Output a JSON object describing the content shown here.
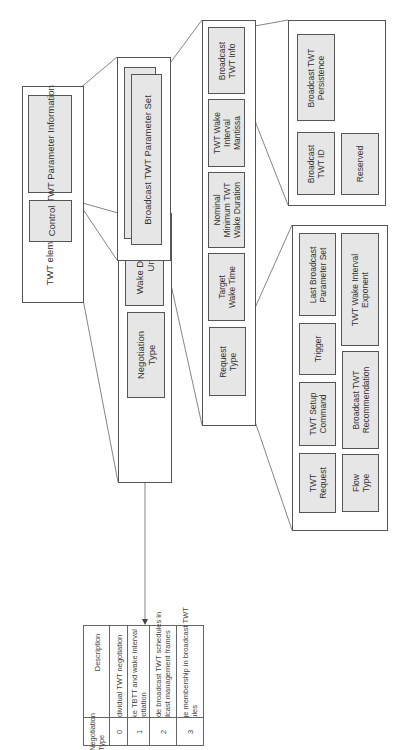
{
  "diagram": {
    "twt_element": {
      "label": "TWT element",
      "fields": {
        "control": "Control",
        "twt_parameter_information": "TWT Parameter Information"
      }
    },
    "control_detail": {
      "fields": {
        "wake_duration_unit": "Wake Duration\nUnit",
        "negotiation_type": "Negotiation\nType"
      }
    },
    "twt_parameter_information_detail": {
      "fields": {
        "broadcast_twt_parameter_set": "Broadcast TWT Parameter Set"
      }
    },
    "broadcast_twt_parameter_set_detail": {
      "fields": {
        "broadcast_twt_info": "Broadcast\nTWT Info",
        "twt_wake_interval_mantissa": "TWT Wake\nInterval\nMantissa",
        "nominal_minimum_twt_wake_duration": "Nominal\nMinimum TWT\nWake Duration",
        "target_wake_time": "Target\nWake Time",
        "request_type": "Request\nType"
      }
    },
    "broadcast_twt_info_detail": {
      "fields": {
        "broadcast_twt_persistence": "Broadcast TWT\nPersistence",
        "broadcast_twt_id": "Broadcast\nTWT ID",
        "reserved": "Reserved"
      }
    },
    "request_type_detail": {
      "fields": {
        "last_broadcast_parameter_set": "Last Broadcast\nParameter Set",
        "trigger": "Trigger",
        "twt_setup_command": "TWT Setup\nCommand",
        "twt_request": "TWT\nRequest",
        "twt_wake_interval_exponent": "TWT Wake Interval\nExponent",
        "broadcast_twt_recommendation": "Broadcast TWT\nRecommendation",
        "flow_type": "Flow\nType"
      }
    },
    "negotiation_table": {
      "headers": [
        "Negotiation\nType",
        "Description"
      ],
      "rows": [
        {
          "type": "0",
          "description": "Individual TWT negotiation"
        },
        {
          "type": "1",
          "description": "Wake TBTT and wake interval\nnegotiation"
        },
        {
          "type": "2",
          "description": "Provide broadcast TWT schedules in\nbroadcast management frames"
        },
        {
          "type": "3",
          "description": "Manage membership in broadcast TWT\nschedules"
        }
      ]
    },
    "colors": {
      "field_fill": "#e6e6e6",
      "border": "#555555",
      "background": "#ffffff"
    }
  }
}
